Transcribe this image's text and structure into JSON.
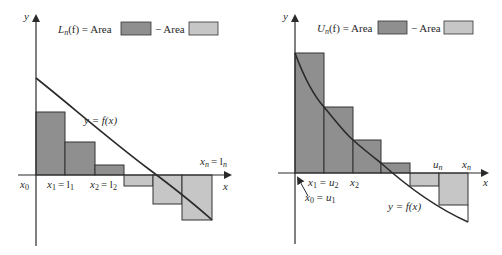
{
  "colors": {
    "dark_fill": "#8f8f8f",
    "light_fill": "#c6c6c6",
    "stroke": "#333333",
    "background": "#ffffff"
  },
  "left": {
    "legend": {
      "lhs": "L",
      "lhs_sub": "n",
      "lhs_arg": "(f) = Area",
      "minus": "− Area"
    },
    "axis_y_label": "y",
    "axis_x_label": "x",
    "curve_label": "y = f(x)",
    "tick_labels": {
      "x0": "x",
      "x0_sub": "0",
      "x1": "x",
      "x1_sub": "1",
      "x1_eq": "= l",
      "x1_eq_sub": "1",
      "x2": "x",
      "x2_sub": "2",
      "x2_eq": "= l",
      "x2_eq_sub": "2",
      "xn": "x",
      "xn_sub": "n",
      "xn_eq": "= l",
      "xn_eq_sub": "n"
    }
  },
  "right": {
    "legend": {
      "lhs": "U",
      "lhs_sub": "n",
      "lhs_arg": "(f) = Area",
      "minus": "− Area"
    },
    "axis_y_label": "y",
    "axis_x_label": "x",
    "curve_label": "y = f(x)",
    "tick_labels": {
      "x0": "x",
      "x0_sub": "0",
      "x0_eq": "= u",
      "x0_eq_sub": "1",
      "x1": "x",
      "x1_sub": "1",
      "x1_eq": "= u",
      "x1_eq_sub": "2",
      "x2": "x",
      "x2_sub": "2",
      "un": "u",
      "un_sub": "n",
      "xn": "x",
      "xn_sub": "n"
    }
  }
}
